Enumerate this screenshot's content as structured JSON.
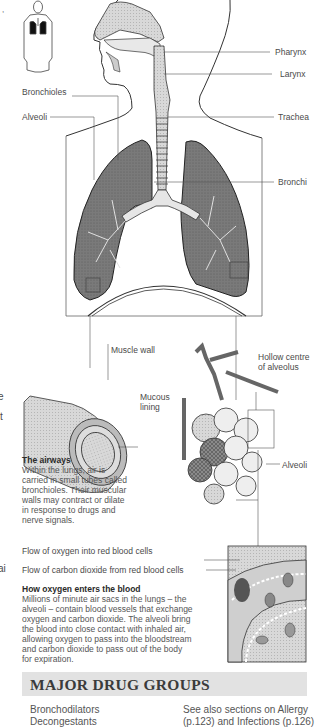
{
  "diagram": {
    "labels": {
      "pharynx": "Pharynx",
      "larynx": "Larynx",
      "trachea": "Trachea",
      "bronchi": "Bronchi",
      "bronchioles": "Bronchioles",
      "alveoli_left": "Alveoli",
      "muscle_wall": "Muscle wall",
      "mucous_lining_1": "Mucous",
      "mucous_lining_2": "lining",
      "hollow_centre_1": "Hollow centre",
      "hollow_centre_2": "of alveolus",
      "alveoli_right": "Alveoli",
      "oxygen_flow": "Flow of oxygen into red blood cells",
      "co2_flow": "Flow of carbon dioxide from red blood cells"
    },
    "margin_fragments": {
      "top": ",",
      "e": "e",
      "t": "t",
      "ai": "ai",
      "dot": "i"
    }
  },
  "captions": {
    "airways": {
      "title": "The airways",
      "lines": [
        "Within the lungs, air is",
        "carried in small tubes called",
        "bronchioles. Their muscular",
        "walls may contract or dilate",
        "in response to drugs and",
        "nerve signals."
      ]
    },
    "oxygen": {
      "title": "How oxygen enters the blood",
      "lines": [
        "Millions of minute air sacs in the lungs – the",
        "alveoli – contain blood vessels that exchange",
        "oxygen and carbon dioxide. The alveoli bring",
        "the blood into close contact with inhaled air,",
        "allowing oxygen to pass into the bloodstream",
        "and carbon dioxide to pass out of the body",
        "for expiration."
      ]
    }
  },
  "drug_groups": {
    "heading": "MAJOR DRUG GROUPS",
    "items": [
      "Bronchodilators",
      "Decongestants"
    ],
    "see_also": [
      "See also sections on Allergy",
      "(p.123) and Infections (p.126)"
    ]
  },
  "colors": {
    "lung_fill": "#6e6e6e",
    "heading_bar": "#e2e2e2",
    "line": "#555555"
  }
}
